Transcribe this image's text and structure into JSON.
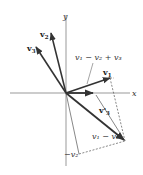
{
  "diagram": {
    "type": "vector-diagram",
    "axes": {
      "x_label": "x",
      "y_label": "y",
      "origin": [
        66,
        93
      ]
    },
    "labels": {
      "v1": "v",
      "v1_sub": "1",
      "v2": "v",
      "v2_sub": "2",
      "v3": "v",
      "v3_sub": "3",
      "v3_prime": "v'",
      "v3_prime_sub": "3",
      "sum_expr": "v₁ − v₂ + v₃",
      "diff_expr": "v₁ − v₂",
      "neg_v2": "−v₂"
    },
    "colors": {
      "vector_dark": "#333333",
      "vector_light": "#888888",
      "axis": "#999999",
      "dashed": "#555555"
    },
    "vectors": [
      {
        "name": "v1",
        "from": [
          66,
          93
        ],
        "to": [
          110,
          78
        ]
      },
      {
        "name": "v2",
        "from": [
          66,
          93
        ],
        "to": [
          51,
          33
        ]
      },
      {
        "name": "v3",
        "from": [
          66,
          93
        ],
        "to": [
          36,
          47
        ]
      },
      {
        "name": "v1-v2+v3",
        "from": [
          66,
          93
        ],
        "to": [
          93,
          93
        ]
      },
      {
        "name": "v1-v2",
        "from": [
          66,
          93
        ],
        "to": [
          125,
          141
        ]
      },
      {
        "name": "-v2",
        "from": [
          66,
          93
        ],
        "to": [
          79,
          154
        ]
      },
      {
        "name": "v3-prime",
        "from": [
          96,
          95
        ],
        "to": [
          125,
          141
        ]
      }
    ]
  }
}
